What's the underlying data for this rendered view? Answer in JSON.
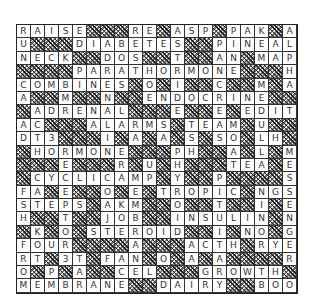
{
  "puzzle": {
    "block_char": "#",
    "rows": [
      "RAISE###RE#ASP#PAK#A",
      "U###DIABETES##PINEAL",
      "NECK##DOS##T##AN#MAP",
      "####PARATHORMONE###H",
      "COMBINES#O#I##C##M#A",
      "A##M##N##ENDOCRINE##",
      "#ADRENAL###E##E#EDIT",
      "AC###ALARMS#TEAM#U##",
      "DT3###I#A#A#S#SO#LH#",
      "#HORMONE###PH##A#L#M",
      "###E###R#U#H###TEA#E",
      "#CYCLICAMP#Y##P####S",
      "FA#E##O#E#TROPIC#NGS",
      "STEPS#AKM##O##T##I#E",
      "H##T##JOB##INSULIN#N",
      "#K#O#STEROID##I#NO#G",
      "FOUR####A###ACTH#RYE",
      "RT#3T#FAN#O#A#A####R",
      "O#P#A##CEL###GROWTH#",
      "MEMBRANE##DAIRY##BOO"
    ]
  }
}
